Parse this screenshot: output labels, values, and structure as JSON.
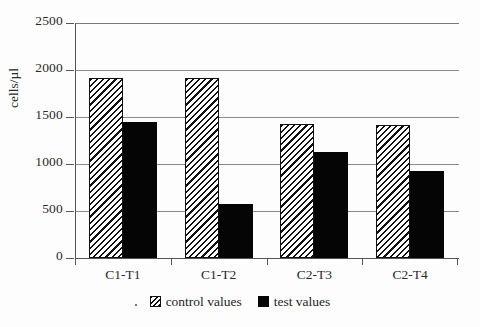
{
  "chart_data": {
    "type": "bar",
    "title": "",
    "subtitle": "",
    "xlabel": "",
    "ylabel": "cells/µl",
    "categories": [
      "C1-T1",
      "C1-T2",
      "C2-T3",
      "C2-T4"
    ],
    "series": [
      {
        "name": "control values",
        "values": [
          1920,
          1920,
          1425,
          1420
        ],
        "fill": "diagonal-hatch",
        "color": "#111111"
      },
      {
        "name": "test values",
        "values": [
          1450,
          570,
          1130,
          930
        ],
        "fill": "solid",
        "color": "#050505"
      }
    ],
    "ylim": [
      0,
      2500
    ],
    "yticks": [
      0,
      500,
      1000,
      1500,
      2000,
      2500
    ],
    "ytick_labels": [
      "0",
      "500",
      "1000",
      "1500",
      "2000",
      "2500"
    ],
    "grid": "horizontal",
    "legend_position": "bottom-center",
    "legend": [
      {
        "label": "control values",
        "swatch": "hatched"
      },
      {
        "label": "test values",
        "swatch": "solid-black"
      }
    ]
  }
}
